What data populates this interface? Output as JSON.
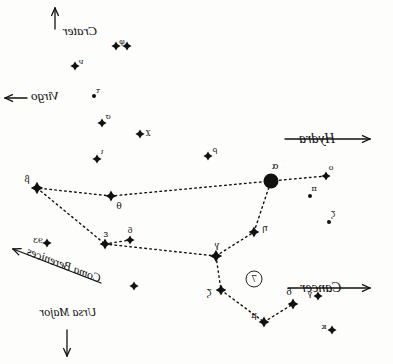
{
  "chart_title": "Leo constellation star chart (mirrored hand drawing)",
  "canvas": {
    "width": 393,
    "height": 364,
    "background": "#fdfdfc",
    "ink": "#111111"
  },
  "chart_data": {
    "type": "scatter",
    "xlabel": "",
    "ylabel": "",
    "xlim": [
      0,
      393
    ],
    "ylim": [
      0,
      364
    ],
    "grid": false,
    "legend": "none",
    "note": "Hand-drawn sky chart, image is mirror-reversed; text reads backwards. Stars plotted in pixel coordinates; magnitude classes set glyph size.",
    "stars": [
      {
        "label": "α",
        "x": 122,
        "y": 181,
        "mag": 1,
        "glyph": "disc"
      },
      {
        "label": "η",
        "x": 139,
        "y": 232,
        "mag": 3,
        "glyph": "spike"
      },
      {
        "label": "γ",
        "x": 177,
        "y": 256,
        "mag": 2,
        "glyph": "spike"
      },
      {
        "label": "ζ",
        "x": 172,
        "y": 290,
        "mag": 3,
        "glyph": "spike"
      },
      {
        "label": "μ",
        "x": 129,
        "y": 322,
        "mag": 3,
        "glyph": "spike"
      },
      {
        "label": "δ",
        "x": 100,
        "y": 304,
        "mag": 3,
        "glyph": "spike"
      },
      {
        "label": "θ",
        "x": 282,
        "y": 196,
        "mag": 3,
        "glyph": "spike"
      },
      {
        "label": "β",
        "x": 356,
        "y": 188,
        "mag": 2,
        "glyph": "spike"
      },
      {
        "label": "ε",
        "x": 288,
        "y": 244,
        "mag": 3,
        "glyph": "spike"
      },
      {
        "label": "δ́",
        "x": 263,
        "y": 240,
        "mag": 4,
        "glyph": "spike"
      },
      {
        "label": "ο",
        "x": 67,
        "y": 176,
        "mag": 4,
        "glyph": "spike"
      },
      {
        "label": "π",
        "x": 83,
        "y": 196,
        "mag": 5,
        "glyph": "dot"
      },
      {
        "label": "ζ́",
        "x": 64,
        "y": 222,
        "mag": 5,
        "glyph": "dot"
      },
      {
        "label": "ρ",
        "x": 185,
        "y": 156,
        "mag": 4,
        "glyph": "spike"
      },
      {
        "label": "χ",
        "x": 253,
        "y": 134,
        "mag": 4,
        "glyph": "spike"
      },
      {
        "label": "σ",
        "x": 291,
        "y": 123,
        "mag": 4,
        "glyph": "spike"
      },
      {
        "label": "ι",
        "x": 296,
        "y": 159,
        "mag": 4,
        "glyph": "spike"
      },
      {
        "label": "τ",
        "x": 299,
        "y": 96,
        "mag": 5,
        "glyph": "dot"
      },
      {
        "label": "ν",
        "x": 318,
        "y": 66,
        "mag": 4,
        "glyph": "spike"
      },
      {
        "label": "φ",
        "x": 277,
        "y": 46,
        "mag": 4,
        "glyph": "spike"
      },
      {
        "label": "φ́",
        "x": 266,
        "y": 46,
        "mag": 4,
        "glyph": "spike"
      },
      {
        "label": "93",
        "x": 346,
        "y": 243,
        "mag": 4,
        "glyph": "spike"
      },
      {
        "label": "γ́",
        "x": 75,
        "y": 296,
        "mag": 4,
        "glyph": "spike"
      },
      {
        "label": "κ",
        "x": 61,
        "y": 330,
        "mag": 4,
        "glyph": "spike"
      },
      {
        "label": "",
        "x": 259,
        "y": 286,
        "mag": 4,
        "glyph": "spike"
      }
    ],
    "connections": [
      [
        67,
        176,
        122,
        181
      ],
      [
        122,
        181,
        282,
        196
      ],
      [
        282,
        196,
        356,
        188
      ],
      [
        356,
        188,
        288,
        244
      ],
      [
        288,
        244,
        177,
        256
      ],
      [
        177,
        256,
        139,
        232
      ],
      [
        139,
        232,
        122,
        181
      ],
      [
        177,
        256,
        172,
        290
      ],
      [
        172,
        290,
        129,
        322
      ],
      [
        129,
        322,
        100,
        304
      ],
      [
        288,
        244,
        263,
        240
      ]
    ]
  },
  "star_labels": [
    {
      "name": "alpha",
      "text": "α",
      "x": 118,
      "y": 166,
      "size": 10
    },
    {
      "name": "eta",
      "text": "η",
      "x": 128,
      "y": 228,
      "size": 9
    },
    {
      "name": "gamma",
      "text": "γ",
      "x": 176,
      "y": 245,
      "size": 9
    },
    {
      "name": "zeta",
      "text": "ζ",
      "x": 184,
      "y": 293,
      "size": 9
    },
    {
      "name": "mu",
      "text": "μ",
      "x": 139,
      "y": 315,
      "size": 9
    },
    {
      "name": "delta",
      "text": "δ",
      "x": 104,
      "y": 292,
      "size": 9
    },
    {
      "name": "theta",
      "text": "θ",
      "x": 274,
      "y": 206,
      "size": 9
    },
    {
      "name": "beta",
      "text": "β",
      "x": 366,
      "y": 179,
      "size": 9
    },
    {
      "name": "epsilon",
      "text": "ε",
      "x": 287,
      "y": 234,
      "size": 9
    },
    {
      "name": "delta-prime",
      "text": "δ",
      "x": 263,
      "y": 231,
      "size": 8
    },
    {
      "name": "omicron",
      "text": "ο",
      "x": 62,
      "y": 168,
      "size": 8
    },
    {
      "name": "pi",
      "text": "π",
      "x": 79,
      "y": 189,
      "size": 8
    },
    {
      "name": "zeta-prime",
      "text": "ζ",
      "x": 60,
      "y": 215,
      "size": 8
    },
    {
      "name": "rho",
      "text": "ρ",
      "x": 178,
      "y": 150,
      "size": 8
    },
    {
      "name": "chi",
      "text": "χ",
      "x": 245,
      "y": 132,
      "size": 8
    },
    {
      "name": "sigma",
      "text": "σ",
      "x": 285,
      "y": 117,
      "size": 8
    },
    {
      "name": "iota",
      "text": "ι",
      "x": 291,
      "y": 152,
      "size": 8
    },
    {
      "name": "tau",
      "text": "τ",
      "x": 295,
      "y": 91,
      "size": 8
    },
    {
      "name": "nu",
      "text": "ν",
      "x": 312,
      "y": 62,
      "size": 8
    },
    {
      "name": "phi",
      "text": "φ",
      "x": 271,
      "y": 42,
      "size": 8
    },
    {
      "name": "star-93",
      "text": "93",
      "x": 355,
      "y": 241,
      "size": 8
    },
    {
      "name": "gamma-prime",
      "text": "γ",
      "x": 83,
      "y": 294,
      "size": 8
    },
    {
      "name": "kappa",
      "text": "κ",
      "x": 69,
      "y": 327,
      "size": 8
    }
  ],
  "circled_marker": {
    "text": "7",
    "x": 139,
    "y": 279
  },
  "constellation_labels": [
    {
      "name": "hydra",
      "text": "Hydra",
      "x": 76,
      "y": 139,
      "size": 14,
      "arrow": "left",
      "arrow_x1": 108,
      "arrow_y1": 139,
      "arrow_x2": 23,
      "arrow_y2": 139
    },
    {
      "name": "cancer",
      "text": "Cancer",
      "x": 72,
      "y": 288,
      "size": 14,
      "arrow": "left",
      "arrow_x1": 105,
      "arrow_y1": 288,
      "arrow_x2": 23,
      "arrow_y2": 288
    },
    {
      "name": "crater",
      "text": "Crater",
      "x": 313,
      "y": 31,
      "size": 13,
      "arrow": "up",
      "arrow_x1": 338,
      "arrow_y1": 29,
      "arrow_x2": 338,
      "arrow_y2": 8
    },
    {
      "name": "virgo",
      "text": "Virgo",
      "x": 348,
      "y": 96,
      "size": 13,
      "arrow": "right",
      "arrow_x1": 366,
      "arrow_y1": 98,
      "arrow_x2": 388,
      "arrow_y2": 98
    },
    {
      "name": "coma-berenices",
      "text": "Coma Berenices",
      "x": 329,
      "y": 265,
      "size": 12,
      "arrow": "diag",
      "arrow_x1": 292,
      "arrow_y1": 283,
      "arrow_x2": 380,
      "arrow_y2": 249
    },
    {
      "name": "ursa-major",
      "text": "Ursa Major",
      "x": 325,
      "y": 312,
      "size": 12,
      "arrow": "down",
      "arrow_x1": 326,
      "arrow_y1": 330,
      "arrow_x2": 326,
      "arrow_y2": 356
    }
  ]
}
